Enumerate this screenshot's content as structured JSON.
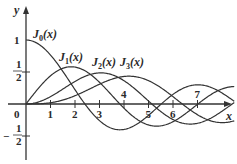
{
  "chart_data": {
    "type": "line",
    "title": "",
    "xlabel": "x",
    "ylabel": "y",
    "xlim": [
      0,
      8.6
    ],
    "ylim": [
      -0.9,
      1.45
    ],
    "grid": false,
    "legend_position": "inline labels",
    "x_ticks": [
      "1",
      "2",
      "3",
      "4",
      "5",
      "6",
      "7"
    ],
    "y_ticks": [
      "1",
      "1/2",
      "-1/2"
    ],
    "origin_label": "0",
    "series": [
      {
        "name": "J0(x)",
        "order": 0,
        "label_sub": "0",
        "x_range": [
          0,
          8.5
        ]
      },
      {
        "name": "J1(x)",
        "order": 1,
        "label_sub": "1",
        "x_range": [
          0,
          8.5
        ]
      },
      {
        "name": "J2(x)",
        "order": 2,
        "label_sub": "2",
        "x_range": [
          0,
          8.5
        ]
      },
      {
        "name": "J3(x)",
        "order": 3,
        "label_sub": "3",
        "x_range": [
          0,
          8.5
        ]
      }
    ],
    "annotations": [
      {
        "text": "J0(x)",
        "near_x": 0.3,
        "near_y": 1.0
      },
      {
        "text": "J1(x)",
        "near_x": 1.8,
        "near_y": 0.6
      },
      {
        "text": "J2(x)",
        "near_x": 3.1,
        "near_y": 0.5
      },
      {
        "text": "J3(x)",
        "near_x": 4.2,
        "near_y": 0.5
      }
    ]
  },
  "axes": {
    "x_label": "x",
    "y_label": "y",
    "origin": "0",
    "x_ticks": [
      "1",
      "2",
      "3",
      "4",
      "5",
      "6",
      "7"
    ],
    "y_tick_one": "1",
    "y_tick_half_num": "1",
    "y_tick_half_den": "2",
    "y_tick_neg_half_num": "1",
    "y_tick_neg_half_den": "2",
    "minus": "−"
  },
  "labels": {
    "J": "J",
    "arg": "(x)",
    "j0": "0",
    "j1": "1",
    "j2": "2",
    "j3": "3"
  },
  "colors": {
    "curve": "#333333",
    "axis": "#333333",
    "text": "#2a2a2a"
  }
}
